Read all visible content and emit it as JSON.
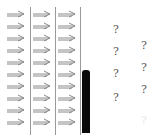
{
  "diagram": {
    "arrow_columns": 3,
    "arrow_rows": 10,
    "arrow_direction": "right",
    "arrow_icon": "right-arrow-icon",
    "arrow_color": "#8a8a8a",
    "divider_color": "#9a9a9a",
    "bar_color": "#0a0a0a",
    "question_marks": [
      {
        "col": 1,
        "row": 1,
        "text": "?"
      },
      {
        "col": 1,
        "row": 2,
        "text": "?"
      },
      {
        "col": 1,
        "row": 3,
        "text": "?"
      },
      {
        "col": 1,
        "row": 4,
        "text": "?"
      },
      {
        "col": 2,
        "row": 1,
        "text": "?"
      },
      {
        "col": 2,
        "row": 2,
        "text": "?"
      },
      {
        "col": 2,
        "row": 3,
        "text": "?"
      },
      {
        "col": 2,
        "row": 4,
        "text": "?",
        "faint": true
      }
    ]
  }
}
